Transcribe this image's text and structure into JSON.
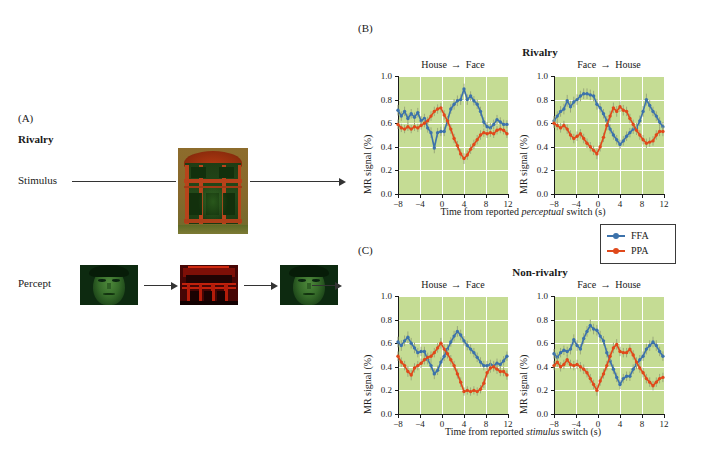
{
  "figure": {
    "panels": {
      "a": {
        "letter": "(A)",
        "title": "Rivalry",
        "row_labels": {
          "stimulus": "Stimulus",
          "percept": "Percept"
        },
        "images": {
          "stimulus": "house-face-rivalry-composite",
          "percept_1": "green-face",
          "percept_2": "red-house",
          "percept_3": "green-face"
        }
      },
      "b": {
        "letter": "(B)",
        "title": "Rivalry",
        "xlabel_pre": "Time from reported ",
        "xlabel_em": "perceptual",
        "xlabel_post": " switch (s)"
      },
      "c": {
        "letter": "(C)",
        "title": "Non-rivalry",
        "xlabel_pre": "Time from reported ",
        "xlabel_em": "stimulus",
        "xlabel_post": " switch (s)"
      }
    },
    "legend": {
      "entries": [
        {
          "label": "FFA",
          "color": "#3c72ab"
        },
        {
          "label": "PPA",
          "color": "#e0491b"
        }
      ]
    },
    "colors": {
      "ffa": "#3c72ab",
      "ppa": "#e0491b",
      "plot_bg": "#c5dc94",
      "grid": "#ffffff",
      "axis": "#1a1a1a"
    }
  },
  "chart_data": [
    {
      "id": "b-left",
      "type": "line",
      "panel": "(B)",
      "panel_title": "Rivalry",
      "title": "House → Face",
      "cond_from": "House",
      "cond_to": "Face",
      "xlabel": "Time from reported perceptual switch (s)",
      "ylabel": "MR signal (%)",
      "xlim": [
        -8,
        12
      ],
      "ylim": [
        0.0,
        1.0
      ],
      "xticks": [
        -8,
        -4,
        0,
        4,
        8,
        12
      ],
      "xtick_labels": [
        "−8",
        "−4",
        "0",
        "4",
        "8",
        "12"
      ],
      "yticks": [
        0.0,
        0.2,
        0.4,
        0.6,
        0.8,
        1.0
      ],
      "ytick_labels": [
        "0.0",
        "0.2",
        "0.4",
        "0.6",
        "0.8",
        "1.0"
      ],
      "grid": true,
      "legend_position": "external-right",
      "x": [
        -8,
        -7.4,
        -6.8,
        -6.2,
        -5.6,
        -5,
        -4.4,
        -3.8,
        -3.2,
        -2.6,
        -2,
        -1.4,
        -0.8,
        -0.2,
        0.4,
        1,
        1.6,
        2.2,
        2.8,
        3.4,
        4,
        4.6,
        5.2,
        5.8,
        6.4,
        7,
        7.6,
        8.2,
        8.8,
        9.4,
        10,
        10.6,
        11.2,
        11.8
      ],
      "series": [
        {
          "name": "FFA",
          "color": "#3c72ab",
          "values": [
            0.71,
            0.66,
            0.7,
            0.64,
            0.68,
            0.65,
            0.69,
            0.62,
            0.64,
            0.56,
            0.52,
            0.39,
            0.52,
            0.53,
            0.53,
            0.62,
            0.72,
            0.76,
            0.79,
            0.8,
            0.89,
            0.8,
            0.83,
            0.79,
            0.76,
            0.7,
            0.61,
            0.57,
            0.56,
            0.59,
            0.63,
            0.61,
            0.59,
            0.59
          ],
          "err": [
            0.045,
            0.04,
            0.04,
            0.04,
            0.04,
            0.04,
            0.04,
            0.04,
            0.04,
            0.04,
            0.045,
            0.045,
            0.04,
            0.04,
            0.04,
            0.04,
            0.04,
            0.045,
            0.045,
            0.045,
            0.045,
            0.045,
            0.04,
            0.04,
            0.04,
            0.04,
            0.04,
            0.04,
            0.04,
            0.04,
            0.04,
            0.04,
            0.04,
            0.035
          ]
        },
        {
          "name": "PPA",
          "color": "#e0491b",
          "values": [
            0.59,
            0.56,
            0.55,
            0.57,
            0.55,
            0.57,
            0.56,
            0.58,
            0.6,
            0.62,
            0.66,
            0.7,
            0.72,
            0.73,
            0.67,
            0.62,
            0.55,
            0.47,
            0.41,
            0.34,
            0.3,
            0.33,
            0.38,
            0.42,
            0.46,
            0.5,
            0.52,
            0.51,
            0.52,
            0.51,
            0.54,
            0.55,
            0.54,
            0.51
          ],
          "err": [
            0.04,
            0.035,
            0.035,
            0.035,
            0.035,
            0.035,
            0.035,
            0.035,
            0.035,
            0.035,
            0.04,
            0.04,
            0.04,
            0.04,
            0.04,
            0.04,
            0.04,
            0.04,
            0.04,
            0.04,
            0.045,
            0.04,
            0.04,
            0.04,
            0.04,
            0.04,
            0.035,
            0.035,
            0.035,
            0.035,
            0.035,
            0.035,
            0.035,
            0.035
          ]
        }
      ]
    },
    {
      "id": "b-right",
      "type": "line",
      "panel": "(B)",
      "panel_title": "Rivalry",
      "title": "Face → House",
      "cond_from": "Face",
      "cond_to": "House",
      "xlabel": "Time from reported perceptual switch (s)",
      "ylabel": "MR signal (%)",
      "xlim": [
        -8,
        12
      ],
      "ylim": [
        0.0,
        1.0
      ],
      "xticks": [
        -8,
        -4,
        0,
        4,
        8,
        12
      ],
      "xtick_labels": [
        "−8",
        "−4",
        "0",
        "4",
        "8",
        "12"
      ],
      "yticks": [
        0.0,
        0.2,
        0.4,
        0.6,
        0.8,
        1.0
      ],
      "ytick_labels": [
        "0.0",
        "0.2",
        "0.4",
        "0.6",
        "0.8",
        "1.0"
      ],
      "grid": true,
      "legend_position": "external-right",
      "x": [
        -8,
        -7.4,
        -6.8,
        -6.2,
        -5.6,
        -5,
        -4.4,
        -3.8,
        -3.2,
        -2.6,
        -2,
        -1.4,
        -0.8,
        -0.2,
        0.4,
        1,
        1.6,
        2.2,
        2.8,
        3.4,
        4,
        4.6,
        5.2,
        5.8,
        6.4,
        7,
        7.6,
        8.2,
        8.8,
        9.4,
        10,
        10.6,
        11.2,
        11.8
      ],
      "series": [
        {
          "name": "FFA",
          "color": "#3c72ab",
          "values": [
            0.62,
            0.66,
            0.7,
            0.72,
            0.79,
            0.74,
            0.78,
            0.8,
            0.83,
            0.85,
            0.85,
            0.84,
            0.83,
            0.76,
            0.73,
            0.68,
            0.62,
            0.55,
            0.5,
            0.46,
            0.42,
            0.45,
            0.49,
            0.52,
            0.55,
            0.56,
            0.62,
            0.7,
            0.8,
            0.75,
            0.7,
            0.66,
            0.61,
            0.57
          ],
          "err": [
            0.04,
            0.04,
            0.045,
            0.045,
            0.05,
            0.05,
            0.045,
            0.045,
            0.045,
            0.045,
            0.045,
            0.045,
            0.045,
            0.045,
            0.04,
            0.04,
            0.04,
            0.04,
            0.04,
            0.04,
            0.04,
            0.04,
            0.04,
            0.04,
            0.04,
            0.04,
            0.045,
            0.045,
            0.05,
            0.045,
            0.04,
            0.04,
            0.04,
            0.04
          ]
        },
        {
          "name": "PPA",
          "color": "#e0491b",
          "values": [
            0.6,
            0.58,
            0.56,
            0.58,
            0.55,
            0.5,
            0.47,
            0.49,
            0.51,
            0.47,
            0.43,
            0.4,
            0.37,
            0.34,
            0.4,
            0.48,
            0.58,
            0.66,
            0.73,
            0.7,
            0.74,
            0.71,
            0.7,
            0.64,
            0.59,
            0.54,
            0.5,
            0.46,
            0.43,
            0.44,
            0.45,
            0.5,
            0.53,
            0.53
          ],
          "err": [
            0.04,
            0.04,
            0.04,
            0.04,
            0.04,
            0.04,
            0.04,
            0.04,
            0.04,
            0.04,
            0.04,
            0.04,
            0.04,
            0.045,
            0.04,
            0.04,
            0.04,
            0.045,
            0.045,
            0.045,
            0.045,
            0.045,
            0.04,
            0.04,
            0.04,
            0.04,
            0.04,
            0.04,
            0.04,
            0.04,
            0.04,
            0.04,
            0.04,
            0.04
          ]
        }
      ]
    },
    {
      "id": "c-left",
      "type": "line",
      "panel": "(C)",
      "panel_title": "Non-rivalry",
      "title": "House → Face",
      "cond_from": "House",
      "cond_to": "Face",
      "xlabel": "Time from reported stimulus switch (s)",
      "ylabel": "MR signal (%)",
      "xlim": [
        -8,
        12
      ],
      "ylim": [
        0.0,
        1.0
      ],
      "xticks": [
        -8,
        -4,
        0,
        4,
        8,
        12
      ],
      "xtick_labels": [
        "−8",
        "−4",
        "0",
        "4",
        "8",
        "12"
      ],
      "yticks": [
        0.0,
        0.2,
        0.4,
        0.6,
        0.8,
        1.0
      ],
      "ytick_labels": [
        "0.0",
        "0.2",
        "0.4",
        "0.6",
        "0.8",
        "1.0"
      ],
      "grid": true,
      "legend_position": "external-right",
      "x": [
        -8,
        -7.4,
        -6.8,
        -6.2,
        -5.6,
        -5,
        -4.4,
        -3.8,
        -3.2,
        -2.6,
        -2,
        -1.4,
        -0.8,
        -0.2,
        0.4,
        1,
        1.6,
        2.2,
        2.8,
        3.4,
        4,
        4.6,
        5.2,
        5.8,
        6.4,
        7,
        7.6,
        8.2,
        8.8,
        9.4,
        10,
        10.6,
        11.2,
        11.8
      ],
      "series": [
        {
          "name": "FFA",
          "color": "#3c72ab",
          "values": [
            0.61,
            0.58,
            0.62,
            0.65,
            0.6,
            0.56,
            0.52,
            0.53,
            0.53,
            0.46,
            0.41,
            0.34,
            0.37,
            0.44,
            0.49,
            0.55,
            0.61,
            0.66,
            0.7,
            0.67,
            0.62,
            0.58,
            0.55,
            0.52,
            0.48,
            0.44,
            0.41,
            0.41,
            0.42,
            0.41,
            0.43,
            0.42,
            0.45,
            0.49
          ],
          "err": [
            0.045,
            0.045,
            0.045,
            0.05,
            0.045,
            0.045,
            0.04,
            0.04,
            0.04,
            0.04,
            0.04,
            0.045,
            0.04,
            0.04,
            0.04,
            0.04,
            0.04,
            0.045,
            0.045,
            0.045,
            0.04,
            0.04,
            0.04,
            0.04,
            0.04,
            0.04,
            0.04,
            0.04,
            0.04,
            0.04,
            0.04,
            0.04,
            0.04,
            0.04
          ]
        },
        {
          "name": "PPA",
          "color": "#e0491b",
          "values": [
            0.49,
            0.44,
            0.41,
            0.36,
            0.33,
            0.39,
            0.41,
            0.43,
            0.46,
            0.48,
            0.49,
            0.52,
            0.56,
            0.6,
            0.55,
            0.51,
            0.46,
            0.41,
            0.34,
            0.27,
            0.19,
            0.2,
            0.19,
            0.2,
            0.19,
            0.21,
            0.26,
            0.35,
            0.39,
            0.4,
            0.38,
            0.36,
            0.36,
            0.33
          ],
          "err": [
            0.04,
            0.04,
            0.04,
            0.045,
            0.045,
            0.04,
            0.04,
            0.04,
            0.04,
            0.04,
            0.04,
            0.04,
            0.04,
            0.045,
            0.04,
            0.04,
            0.04,
            0.04,
            0.04,
            0.04,
            0.035,
            0.035,
            0.035,
            0.035,
            0.035,
            0.035,
            0.04,
            0.04,
            0.04,
            0.04,
            0.04,
            0.04,
            0.04,
            0.04
          ]
        }
      ]
    },
    {
      "id": "c-right",
      "type": "line",
      "panel": "(C)",
      "panel_title": "Non-rivalry",
      "title": "Face → House",
      "cond_from": "Face",
      "cond_to": "House",
      "xlabel": "Time from reported stimulus switch (s)",
      "ylabel": "MR signal (%)",
      "xlim": [
        -8,
        12
      ],
      "ylim": [
        0.0,
        1.0
      ],
      "xticks": [
        -8,
        -4,
        0,
        4,
        8,
        12
      ],
      "xtick_labels": [
        "−8",
        "−4",
        "0",
        "4",
        "8",
        "12"
      ],
      "yticks": [
        0.0,
        0.2,
        0.4,
        0.6,
        0.8,
        1.0
      ],
      "ytick_labels": [
        "0.0",
        "0.2",
        "0.4",
        "0.6",
        "0.8",
        "1.0"
      ],
      "grid": true,
      "legend_position": "external-right",
      "x": [
        -8,
        -7.4,
        -6.8,
        -6.2,
        -5.6,
        -5,
        -4.4,
        -3.8,
        -3.2,
        -2.6,
        -2,
        -1.4,
        -0.8,
        -0.2,
        0.4,
        1,
        1.6,
        2.2,
        2.8,
        3.4,
        4,
        4.6,
        5.2,
        5.8,
        6.4,
        7,
        7.6,
        8.2,
        8.8,
        9.4,
        10,
        10.6,
        11.2,
        11.8
      ],
      "series": [
        {
          "name": "FFA",
          "color": "#3c72ab",
          "values": [
            0.51,
            0.48,
            0.52,
            0.54,
            0.53,
            0.55,
            0.63,
            0.58,
            0.55,
            0.64,
            0.7,
            0.75,
            0.72,
            0.71,
            0.66,
            0.62,
            0.52,
            0.45,
            0.38,
            0.31,
            0.25,
            0.3,
            0.32,
            0.32,
            0.38,
            0.42,
            0.46,
            0.49,
            0.55,
            0.58,
            0.61,
            0.58,
            0.53,
            0.49
          ],
          "err": [
            0.04,
            0.04,
            0.04,
            0.04,
            0.04,
            0.045,
            0.045,
            0.045,
            0.045,
            0.045,
            0.045,
            0.05,
            0.045,
            0.045,
            0.045,
            0.04,
            0.04,
            0.04,
            0.04,
            0.04,
            0.04,
            0.04,
            0.04,
            0.04,
            0.04,
            0.04,
            0.04,
            0.04,
            0.045,
            0.045,
            0.045,
            0.045,
            0.04,
            0.04
          ]
        },
        {
          "name": "PPA",
          "color": "#e0491b",
          "values": [
            0.41,
            0.44,
            0.4,
            0.42,
            0.46,
            0.42,
            0.41,
            0.42,
            0.4,
            0.38,
            0.35,
            0.3,
            0.25,
            0.2,
            0.28,
            0.34,
            0.41,
            0.49,
            0.56,
            0.59,
            0.53,
            0.52,
            0.52,
            0.55,
            0.5,
            0.44,
            0.39,
            0.35,
            0.3,
            0.27,
            0.24,
            0.27,
            0.3,
            0.31
          ],
          "err": [
            0.04,
            0.04,
            0.04,
            0.04,
            0.04,
            0.04,
            0.04,
            0.04,
            0.04,
            0.04,
            0.04,
            0.04,
            0.04,
            0.045,
            0.04,
            0.04,
            0.04,
            0.04,
            0.045,
            0.045,
            0.04,
            0.04,
            0.04,
            0.04,
            0.04,
            0.04,
            0.04,
            0.04,
            0.04,
            0.04,
            0.04,
            0.04,
            0.04,
            0.04
          ]
        }
      ]
    }
  ]
}
